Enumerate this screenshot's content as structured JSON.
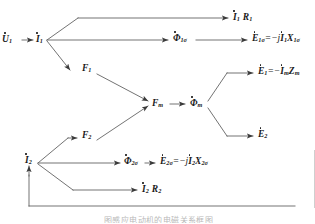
{
  "diagram": {
    "type": "signal-flow",
    "line_color": "#555555",
    "text_color": "#1a1a1a",
    "nodes": {
      "u1": {
        "base": "U",
        "sub": "1",
        "dot": true,
        "label": "U̇1"
      },
      "i1": {
        "base": "I",
        "sub": "1",
        "dot": true,
        "label": "İ1"
      },
      "i1r1": {
        "label": "İ1 R1"
      },
      "phi1s": {
        "label": "Φ̇1σ"
      },
      "e1s_eq": {
        "label": "Ė1σ = −jİ1X1σ"
      },
      "f1": {
        "label": "F1"
      },
      "f2": {
        "label": "F2"
      },
      "fm": {
        "label": "Fm"
      },
      "phim": {
        "label": "Φ̇m"
      },
      "e1_eq": {
        "label": "Ė1 = −Im Zm"
      },
      "e2": {
        "label": "Ė2"
      },
      "i2": {
        "base": "I",
        "sub": "2",
        "dot": true,
        "label": "İ2"
      },
      "phi2s": {
        "label": "Φ̇2σ"
      },
      "e2s_eq": {
        "label": "Ė2σ = −jİ2X2σ"
      },
      "i2r2": {
        "label": "İ2 R2"
      }
    },
    "labels": {
      "u1_base": "U",
      "u1_sub": "1",
      "i1_base": "I",
      "i1_sub": "1",
      "arrow": "→",
      "i1r1_base": "I",
      "i1r1_sub": "1",
      "i1r1_r": "R",
      "i1r1_rsub": "1",
      "phi1s_base": "Φ",
      "phi1s_sub": "1σ",
      "e1s_base": "E",
      "e1s_sub": "1σ",
      "e1s_rhs_op": "=",
      "e1s_rhs_sign": "−j",
      "e1s_rhs_i": "I",
      "e1s_rhs_isub": "1",
      "e1s_rhs_x": "X",
      "e1s_rhs_xsub": "1σ",
      "f1_base": "F",
      "f1_sub": "1",
      "f2_base": "F",
      "f2_sub": "2",
      "fm_base": "F",
      "fm_sub": "m",
      "phim_base": "Φ",
      "phim_sub": "m",
      "e1_base": "E",
      "e1_sub": "1",
      "e1_op": "=",
      "e1_sign": "−",
      "e1_i": "I",
      "e1_isub": "m",
      "e1_z": "Z",
      "e1_zsub": "m",
      "e2_base": "E",
      "e2_sub": "2",
      "i2_base": "I",
      "i2_sub": "2",
      "phi2s_base": "Φ",
      "phi2s_sub": "2σ",
      "e2s_base": "E",
      "e2s_sub": "2σ",
      "e2s_op": "=",
      "e2s_sign": "−j",
      "e2s_i": "I",
      "e2s_isub": "2",
      "e2s_x": "X",
      "e2s_xsub": "2σ",
      "i2r2_base": "I",
      "i2r2_sub": "2",
      "i2r2_r": "R",
      "i2r2_rsub": "2"
    },
    "caption": "图感应电动机的电磁关系框图"
  }
}
